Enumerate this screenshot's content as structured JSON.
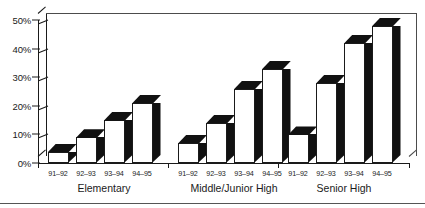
{
  "chart_data": {
    "type": "bar",
    "title": "",
    "subtitle": "",
    "xlabel": "",
    "ylabel": "",
    "ylim": [
      0,
      50
    ],
    "grid": false,
    "legend": "none",
    "style": "3d-bar",
    "y_ticks": [
      "0%",
      "10%",
      "20%",
      "30%",
      "40%",
      "50%"
    ],
    "y_tick_values": [
      0,
      10,
      20,
      30,
      40,
      50
    ],
    "categories": [
      "91–92",
      "92–93",
      "93–94",
      "94–95"
    ],
    "groups": [
      {
        "name": "Elementary",
        "categories": [
          "91–92",
          "92–93",
          "93–94",
          "94–95"
        ],
        "values": [
          4,
          9,
          15,
          21
        ]
      },
      {
        "name": "Middle/Junior High",
        "categories": [
          "91–92",
          "92–93",
          "93–94",
          "94–95"
        ],
        "values": [
          7,
          14,
          26,
          33
        ]
      },
      {
        "name": "Senior High",
        "categories": [
          "91–92",
          "92–93",
          "93–94",
          "94–95"
        ],
        "values": [
          10,
          28,
          42,
          48
        ]
      }
    ],
    "colors": {
      "bar_face": "#ffffff",
      "bar_shadow": "#111111",
      "axis": "#1a1a1a",
      "frame": "#4c4c4c",
      "background": "#ffffff"
    }
  },
  "axis": {
    "y_labels": [
      {
        "text": "50%",
        "value": 50
      },
      {
        "text": "40%",
        "value": 40
      },
      {
        "text": "30%",
        "value": 30
      },
      {
        "text": "20%",
        "value": 20
      },
      {
        "text": "10%",
        "value": 10
      },
      {
        "text": "0%",
        "value": 0
      }
    ]
  },
  "groups_labels": {
    "elementary": "Elementary",
    "middle": "Middle/Junior High",
    "senior": "Senior High"
  }
}
